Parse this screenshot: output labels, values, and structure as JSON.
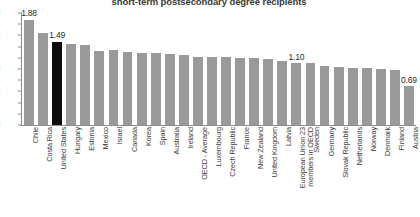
{
  "chart_data": {
    "type": "bar",
    "title": "short-term postsecondary degree recipients",
    "xlabel": "",
    "ylabel": "",
    "ylim": [
      0.0,
      2.0
    ],
    "yticks": [
      "0.0",
      "0.2",
      "0.4",
      "0.6",
      "0.8",
      "1.0",
      "1.2",
      "1.4",
      "1.6",
      "1.8",
      "2.0"
    ],
    "ytick_values": [
      0.0,
      0.2,
      0.4,
      0.6,
      0.8,
      1.0,
      1.2,
      1.4,
      1.6,
      1.8,
      2.0
    ],
    "grid": false,
    "legend": "none",
    "bar_color": "#9a9a9a",
    "highlight_color": "#0d0d0d",
    "categories": [
      "Chile",
      "Costa Rica",
      "United States",
      "Hungary",
      "Estonia",
      "Mexico",
      "Israel",
      "Canada",
      "Korea",
      "Spain",
      "Australia",
      "Ireland",
      "OECD - Average",
      "Luxembourg",
      "Czech Republic",
      "France",
      "New Zealand",
      "United Kingdom",
      "Latvia",
      "European Union 23 members in OECD",
      "Sweden",
      "Germany",
      "Slovak Republic",
      "Netherlands",
      "Norway",
      "Denmark",
      "Finland",
      "Austria"
    ],
    "values": [
      1.88,
      1.64,
      1.49,
      1.45,
      1.43,
      1.33,
      1.34,
      1.31,
      1.28,
      1.28,
      1.26,
      1.25,
      1.22,
      1.22,
      1.21,
      1.2,
      1.19,
      1.18,
      1.15,
      1.1,
      1.1,
      1.05,
      1.04,
      1.02,
      1.02,
      1.0,
      0.99,
      0.69
    ],
    "highlight_index": 2,
    "annotations": [
      {
        "index": 0,
        "label": "1.88"
      },
      {
        "index": 2,
        "label": "1.49"
      },
      {
        "index": 19,
        "label": "1.10"
      },
      {
        "index": 27,
        "label": "0.69"
      }
    ]
  }
}
